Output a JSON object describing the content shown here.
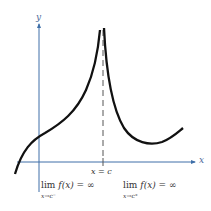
{
  "figure": {
    "axes": {
      "x_label": "x",
      "y_label": "y",
      "color": "#3e6fa8"
    },
    "curve_color": "#111111",
    "asymptote": {
      "label": "x = c",
      "style": "dashed"
    },
    "limits": {
      "left": {
        "word": "lim",
        "subscript": "x→c⁻",
        "expr": "f(x) = ∞"
      },
      "right": {
        "word": "lim",
        "subscript": "x→c⁺",
        "expr": "f(x) = ∞"
      }
    }
  }
}
